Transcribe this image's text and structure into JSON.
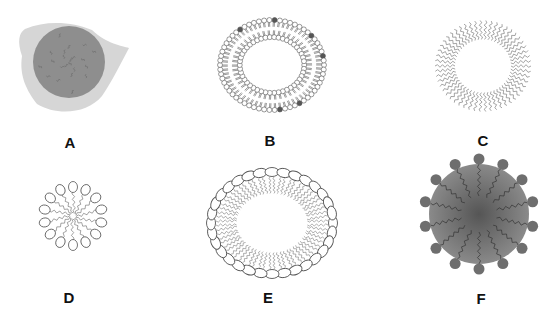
{
  "figure": {
    "background": "#ffffff",
    "panels": [
      {
        "id": "A",
        "label": "A",
        "structure": "solid-lipid-core-with-matrix",
        "label_pos": [
          70,
          135
        ],
        "center": [
          67,
          66
        ]
      },
      {
        "id": "B",
        "label": "B",
        "structure": "liposome-bilayer-vesicle",
        "label_pos": [
          270,
          133
        ],
        "center": [
          272,
          65
        ]
      },
      {
        "id": "C",
        "label": "C",
        "structure": "tail-ring-vesicle",
        "label_pos": [
          483,
          133
        ],
        "center": [
          483,
          66
        ]
      },
      {
        "id": "D",
        "label": "D",
        "structure": "micelle",
        "label_pos": [
          69,
          290
        ],
        "center": [
          73,
          216
        ]
      },
      {
        "id": "E",
        "label": "E",
        "structure": "large-monolayer-vesicle",
        "label_pos": [
          268,
          290
        ],
        "center": [
          272,
          223
        ]
      },
      {
        "id": "F",
        "label": "F",
        "structure": "solid-lipid-nanoparticle",
        "label_pos": [
          481,
          291
        ],
        "center": [
          479,
          214
        ]
      }
    ],
    "colors": {
      "outline": "#555555",
      "head_fill": "#ffffff",
      "matrix_light": "#d6d6d6",
      "core_grey": "#8e8e8e",
      "f_core_center": "#555555",
      "f_core_edge": "#8a8a8a",
      "f_head": "#6e6e6e",
      "dark_marker": "#555555"
    }
  }
}
